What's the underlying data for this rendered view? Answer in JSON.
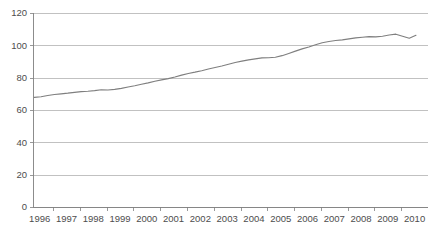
{
  "chart_data": {
    "type": "line",
    "title": "",
    "subtitle": "",
    "xlabel": "",
    "ylabel": "",
    "xlim": [
      1995.75,
      2010.5
    ],
    "ylim": [
      0,
      120
    ],
    "grid": true,
    "legend": false,
    "legend_position": "none",
    "line_color": "#7f7f7f",
    "y_ticks": [
      0,
      20,
      40,
      60,
      80,
      100,
      120
    ],
    "y_tick_labels": [
      "0",
      "20",
      "40",
      "60",
      "80",
      "100",
      "120"
    ],
    "x_ticks": [
      1996,
      1997,
      1998,
      1999,
      2000,
      2001,
      2002,
      2003,
      2004,
      2005,
      2006,
      2007,
      2008,
      2009,
      2010
    ],
    "x_tick_labels": [
      "1996",
      "1997",
      "1998",
      "1999",
      "2000",
      "2001",
      "2002",
      "2003",
      "2004",
      "2005",
      "2006",
      "2007",
      "2008",
      "2009",
      "2010"
    ],
    "series": [
      {
        "name": "index",
        "x": [
          1995.8,
          1996.05,
          1996.3,
          1996.55,
          1996.8,
          1997.05,
          1997.3,
          1997.55,
          1997.8,
          1998.05,
          1998.3,
          1998.55,
          1998.8,
          1999.05,
          1999.3,
          1999.55,
          1999.8,
          2000.05,
          2000.3,
          2000.55,
          2000.8,
          2001.05,
          2001.3,
          2001.55,
          2001.8,
          2002.05,
          2002.3,
          2002.55,
          2002.8,
          2003.05,
          2003.3,
          2003.55,
          2003.8,
          2004.05,
          2004.3,
          2004.55,
          2004.8,
          2005.05,
          2005.3,
          2005.55,
          2005.8,
          2006.05,
          2006.3,
          2006.55,
          2006.8,
          2007.05,
          2007.3,
          2007.55,
          2007.8,
          2008.05,
          2008.3,
          2008.55,
          2008.8,
          2009.05,
          2009.3,
          2009.55,
          2009.8,
          2010.05
        ],
        "values": [
          67.8,
          68.2,
          69.0,
          69.6,
          70.0,
          70.4,
          70.9,
          71.4,
          71.6,
          72.0,
          72.5,
          72.4,
          72.8,
          73.4,
          74.2,
          75.0,
          75.9,
          76.8,
          77.8,
          78.6,
          79.4,
          80.4,
          81.6,
          82.6,
          83.4,
          84.3,
          85.4,
          86.3,
          87.2,
          88.3,
          89.4,
          90.2,
          91.0,
          91.6,
          92.2,
          92.3,
          92.6,
          93.6,
          95.0,
          96.4,
          97.8,
          99.0,
          100.4,
          101.6,
          102.4,
          103.0,
          103.4,
          104.0,
          104.6,
          105.0,
          105.4,
          105.2,
          105.6,
          106.4,
          106.9,
          105.6,
          104.4,
          106.2
        ]
      }
    ]
  },
  "plot_geometry": {
    "left": 33,
    "right": 428,
    "top": 13,
    "bottom": 207
  }
}
